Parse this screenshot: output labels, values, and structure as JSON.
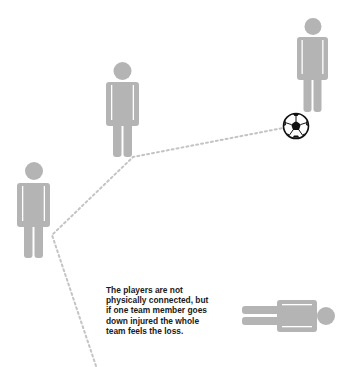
{
  "caption": {
    "lines": [
      "The players are not",
      "physically connected, but",
      "if one team member goes",
      "down injured the whole",
      "team feels the loss."
    ]
  },
  "colors": {
    "figure": "#b4b4b4",
    "dotted_line": "#c4c4c4",
    "text": "#1a1a1a",
    "ball_outline": "#111111",
    "background": "#ffffff"
  },
  "figures": [
    {
      "name": "standing-player-left",
      "pose": "standing"
    },
    {
      "name": "standing-player-middle",
      "pose": "standing"
    },
    {
      "name": "standing-player-right",
      "pose": "standing"
    },
    {
      "name": "injured-player",
      "pose": "lying-down"
    }
  ],
  "icons": [
    "person-icon",
    "soccer-ball-icon"
  ]
}
